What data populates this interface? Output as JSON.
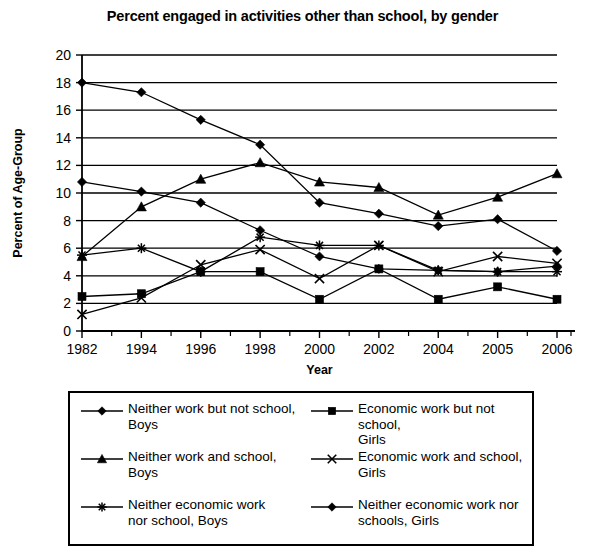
{
  "chart_data": {
    "type": "line",
    "title": "Percent engaged in activities other than school, by gender",
    "xlabel": "Year",
    "ylabel": "Percent of Age-Group",
    "categories": [
      "1982",
      "1994",
      "1996",
      "1998",
      "2000",
      "2002",
      "2004",
      "2005",
      "2006"
    ],
    "ylim": [
      0,
      20
    ],
    "ytick_step": 2,
    "yticks": [
      "0",
      "2",
      "4",
      "6",
      "8",
      "10",
      "12",
      "14",
      "16",
      "18",
      "20"
    ],
    "grid": "horizontal",
    "legend_position": "below-plot",
    "series": [
      {
        "name": "Neither work but not school, Boys",
        "marker": "diamond",
        "values": [
          18.0,
          17.3,
          15.3,
          13.5,
          9.3,
          8.5,
          7.6,
          8.1,
          5.8
        ]
      },
      {
        "name": "Neither work and school, Boys",
        "marker": "triangle",
        "values": [
          5.4,
          9.0,
          11.0,
          12.2,
          10.8,
          10.4,
          8.4,
          9.7,
          11.4
        ]
      },
      {
        "name": "Neither economic work nor school, Boys",
        "marker": "asterisk",
        "values": [
          5.5,
          6.0,
          4.3,
          6.8,
          6.2,
          6.2,
          4.4,
          4.3,
          4.3
        ]
      },
      {
        "name": "Economic work but not school, Girls",
        "marker": "square",
        "values": [
          2.5,
          2.7,
          4.3,
          4.3,
          2.3,
          4.5,
          2.3,
          3.2,
          2.3
        ]
      },
      {
        "name": "Economic work and school, Girls",
        "marker": "cross",
        "values": [
          1.2,
          2.4,
          4.8,
          5.9,
          3.8,
          6.2,
          4.3,
          5.4,
          4.9
        ]
      },
      {
        "name": "Neither economic work nor schools, Girls",
        "marker": "diamond",
        "values": [
          10.8,
          10.1,
          9.3,
          7.3,
          5.4,
          4.5,
          4.4,
          4.3,
          4.7
        ]
      }
    ]
  },
  "legend": {
    "entries": [
      {
        "label": "Neither work but not school,\nBoys",
        "marker": "diamond"
      },
      {
        "label": "Neither work and school,\nBoys",
        "marker": "triangle"
      },
      {
        "label": "Neither economic work\nnor school, Boys",
        "marker": "asterisk"
      },
      {
        "label": "Economic work but not school,\nGirls",
        "marker": "square"
      },
      {
        "label": "Economic work and school,\nGirls",
        "marker": "cross"
      },
      {
        "label": "Neither economic work nor\nschools, Girls",
        "marker": "diamond"
      }
    ]
  },
  "colors": {
    "ink": "#000000",
    "background": "#ffffff"
  }
}
